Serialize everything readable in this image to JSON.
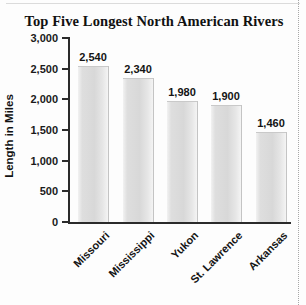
{
  "chart_data": {
    "type": "bar",
    "title": "Top Five Longest North American Rivers",
    "xlabel": "",
    "ylabel": "Length in Miles",
    "categories": [
      "Missouri",
      "Mississippi",
      "Yukon",
      "St. Lawrence",
      "Arkansas"
    ],
    "values": [
      2540,
      2340,
      1980,
      1900,
      1460
    ],
    "value_labels": [
      "2,540",
      "2,340",
      "1,980",
      "1,900",
      "1,460"
    ],
    "ylim": [
      0,
      3000
    ],
    "ytick_values": [
      0,
      500,
      1000,
      1500,
      2000,
      2500,
      3000
    ],
    "ytick_labels": [
      "0",
      "500",
      "1,000",
      "1,500",
      "2,000",
      "2,500",
      "3,000"
    ],
    "grid": false,
    "legend": false,
    "bar_color": "#dcdcdc",
    "axis_color": "#2b2b2b",
    "text_color": "#141414"
  }
}
